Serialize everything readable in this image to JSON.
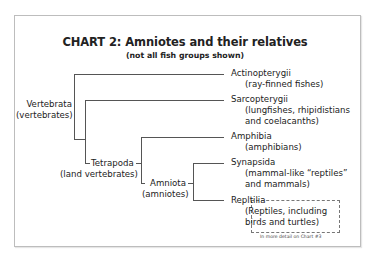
{
  "title": "CHART 2: Amniotes and their relatives",
  "subtitle": "(not all fish groups shown)",
  "nodes": {
    "vertebrata": {
      "name": "Vertebrata",
      "common": "(vertebrates)"
    },
    "tetrapoda": {
      "name": "Tetrapoda",
      "common": "(land vertebrates)"
    },
    "amniota": {
      "name": "Amniota",
      "common": "(amniotes)"
    }
  },
  "leaves": [
    {
      "name": "Actinopterygii",
      "common": [
        "(ray-finned fishes)"
      ]
    },
    {
      "name": "Sarcopterygii",
      "common": [
        "(lungfishes, rhipidistians",
        "and coelacanths)"
      ]
    },
    {
      "name": "Amphibia",
      "common": [
        "(amphibians)"
      ]
    },
    {
      "name": "Synapsida",
      "common": [
        "(mammal-like “reptiles”",
        "and mammals)"
      ]
    },
    {
      "name": "Repltilia",
      "common": [
        "(Reptiles, including",
        "birds and turtles)"
      ]
    }
  ],
  "note": "In more detail on Chart #3"
}
